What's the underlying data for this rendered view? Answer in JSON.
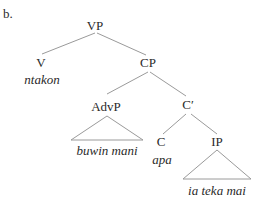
{
  "example_label": "b.",
  "tree": {
    "root": "VP",
    "nodes": {
      "vp": "VP",
      "v": "V",
      "v_word": "ntakon",
      "cp": "CP",
      "advp": "AdvP",
      "advp_words": "buwin mani",
      "cbar": "C′",
      "c": "C",
      "c_word": "apa",
      "ip": "IP",
      "ip_words": "ia teka mai"
    }
  },
  "colors": {
    "line": "#9a9a9a",
    "text": "#2a2a2a"
  }
}
